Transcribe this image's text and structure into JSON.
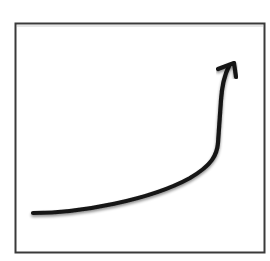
{
  "diagram": {
    "type": "growth-curve-icon",
    "colors": {
      "background": "#ffffff",
      "frame_stroke": "#3a3a3a",
      "curve_stroke": "#151515",
      "shadow": "#9a9a9a"
    },
    "frame": {
      "x": 15,
      "y": 23,
      "width": 250,
      "height": 230,
      "stroke_width": 2
    },
    "curve": {
      "start": [
        33,
        213
      ],
      "bend": [
        217,
        148
      ],
      "end": [
        231,
        63
      ],
      "stroke_width": 4
    },
    "arrowhead": {
      "tip": [
        235,
        63
      ],
      "left_wing": [
        217,
        69
      ],
      "right_wing": [
        236,
        77
      ]
    },
    "labels": []
  }
}
